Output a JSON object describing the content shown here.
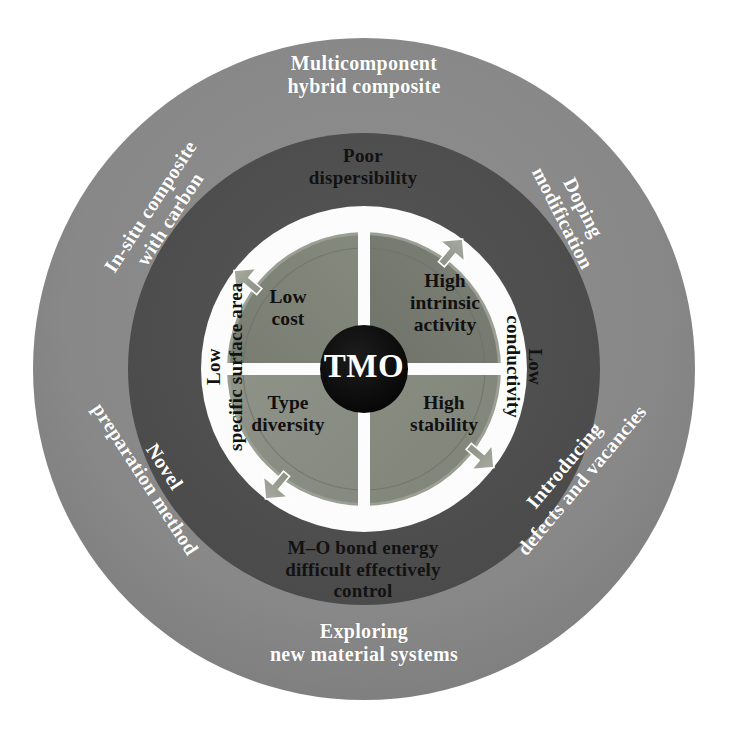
{
  "figure": {
    "center": {
      "label": "TMO"
    },
    "colors": {
      "background": "#ffffff",
      "outer_ring": "#8a8a8a",
      "middle_ring": "#4f4f4f",
      "white_gap": "#fdfdfd",
      "quadrant_top_left": "#7e8277",
      "quadrant_top_right": "#74786f",
      "quadrant_bottom_left": "#8b8f84",
      "quadrant_bottom_right": "#85897e",
      "core": "#0d0d0d",
      "arrow_fill": "#989c91",
      "outer_text": "#ffffff",
      "inner_text": "#111111"
    },
    "inner_quadrants": [
      {
        "id": "top-left",
        "label": "Low\ncost"
      },
      {
        "id": "top-right",
        "label": "High\nintrinsic\nactivity"
      },
      {
        "id": "bottom-left",
        "label": "Type\ndiversity"
      },
      {
        "id": "bottom-right",
        "label": "High\nstability"
      }
    ],
    "middle_ring_labels": [
      {
        "id": "top",
        "label": "Poor\ndispersibility",
        "rotation": 0
      },
      {
        "id": "right",
        "label": "Low\nconductivity",
        "rotation": 90
      },
      {
        "id": "bottom",
        "label": "M–O bond energy\ndifficult effectively\ncontrol",
        "rotation": 0
      },
      {
        "id": "left",
        "label": "Low\nspecific surface area",
        "rotation": -90
      }
    ],
    "outer_ring_labels": [
      {
        "id": "top",
        "label": "Multicomponent\nhybrid composite",
        "rotation": 0
      },
      {
        "id": "top-right",
        "label": "Doping\nmodification",
        "rotation": 63
      },
      {
        "id": "bottom-right",
        "label": "Introducing\ndefects and vacancies",
        "rotation": -50
      },
      {
        "id": "bottom",
        "label": "Exploring\nnew material systems",
        "rotation": 0
      },
      {
        "id": "bottom-left",
        "label": "Novel\npreparation method",
        "rotation": 57
      },
      {
        "id": "top-left",
        "label": "In-situ composite\nwith carbon",
        "rotation": -57
      }
    ],
    "cycle_arrows": {
      "direction": "clockwise",
      "count": 4,
      "positions": [
        "top",
        "right",
        "bottom",
        "left"
      ]
    }
  }
}
